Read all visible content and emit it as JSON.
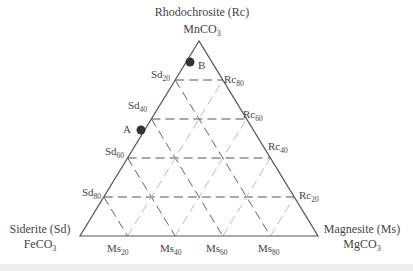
{
  "diagram": {
    "type": "ternary",
    "vertices": {
      "top": {
        "name": "Rhodochrosite (Rc)",
        "formula": "MnCO",
        "formula_sub": "3"
      },
      "left": {
        "name": "Siderite (Sd)",
        "formula": "FeCO",
        "formula_sub": "3"
      },
      "right": {
        "name": "Magnesite (Ms)",
        "formula": "MgCO",
        "formula_sub": "3"
      }
    },
    "left_ticks": [
      {
        "base": "Sd",
        "sub": "20"
      },
      {
        "base": "Sd",
        "sub": "40"
      },
      {
        "base": "Sd",
        "sub": "60"
      },
      {
        "base": "Sd",
        "sub": "80"
      }
    ],
    "right_ticks": [
      {
        "base": "Rc",
        "sub": "80"
      },
      {
        "base": "Rc",
        "sub": "60"
      },
      {
        "base": "Rc",
        "sub": "40"
      },
      {
        "base": "Rc",
        "sub": "20"
      }
    ],
    "bottom_ticks": [
      {
        "base": "Ms",
        "sub": "20"
      },
      {
        "base": "Ms",
        "sub": "40"
      },
      {
        "base": "Ms",
        "sub": "60"
      },
      {
        "base": "Ms",
        "sub": "80"
      }
    ],
    "points": [
      {
        "label": "A"
      },
      {
        "label": "B"
      }
    ],
    "colors": {
      "outline": "#555555",
      "grid_dark": "#555555",
      "grid_light": "#bbbbbb",
      "point": "#333333"
    }
  }
}
